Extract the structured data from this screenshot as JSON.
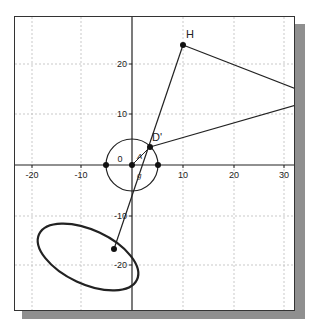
{
  "graph": {
    "x_ticks": [
      "-20",
      "-10",
      "10",
      "20",
      "30"
    ],
    "y_ticks": [
      "20",
      "10",
      "-10",
      "-20"
    ],
    "origin_label": "0",
    "points": {
      "H": {
        "label": "H",
        "x": 10,
        "y": 23.5
      },
      "D_prime": {
        "label": "D'",
        "x": 3.5,
        "y": 3.5
      }
    },
    "segment_labels": {
      "a": "A",
      "b": "g"
    },
    "circle": {
      "center": [
        0,
        0
      ],
      "radius": 5
    },
    "colors": {
      "axis": "#222222",
      "grid": "#bbbbbb",
      "stroke": "#222222",
      "shadow": "#8f8f8f"
    }
  }
}
